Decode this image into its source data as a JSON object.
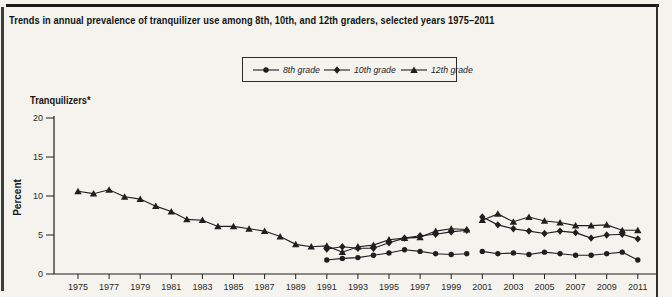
{
  "page": {
    "title": "Trends in annual prevalence of tranquilizer use among 8th, 10th, and 12th graders, selected years 1975–2011"
  },
  "legend": {
    "items": [
      {
        "label": "8th grade",
        "marker": "circle"
      },
      {
        "label": "10th grade",
        "marker": "diamond"
      },
      {
        "label": "12th grade",
        "marker": "triangle"
      }
    ]
  },
  "axis": {
    "substance_label": "Tranquilizers*",
    "y_axis_title": "Percent"
  },
  "colors": {
    "ink": "#1f1f1f",
    "background": "#f4f3ee",
    "border": "#1b1b1b"
  },
  "chart_data": {
    "type": "line",
    "title": "Trends in annual prevalence of tranquilizer use among 8th, 10th, and 12th graders, selected years 1975–2011",
    "xlabel": "",
    "ylabel": "Percent",
    "ylim": [
      0,
      20
    ],
    "y_ticks": [
      0,
      5,
      10,
      15,
      20
    ],
    "x_tick_labels": [
      "1975",
      "1977",
      "1979",
      "1981",
      "1983",
      "1985",
      "1987",
      "1989",
      "1991",
      "1993",
      "1995",
      "1997",
      "1999",
      "2001",
      "2003",
      "2005",
      "2007",
      "2009",
      "2011"
    ],
    "grid": false,
    "legend_position": "top-center",
    "line_break": "all series break between 2000 and 2001 (revised question indicated by asterisk)",
    "series": [
      {
        "name": "8th grade",
        "marker": "circle",
        "segments": [
          {
            "x": [
              1991,
              1992,
              1993,
              1994,
              1995,
              1996,
              1997,
              1998,
              1999,
              2000
            ],
            "y": [
              1.8,
              2.0,
              2.1,
              2.4,
              2.7,
              3.1,
              2.9,
              2.6,
              2.5,
              2.6
            ]
          },
          {
            "x": [
              2001,
              2002,
              2003,
              2004,
              2005,
              2006,
              2007,
              2008,
              2009,
              2010,
              2011
            ],
            "y": [
              2.9,
              2.6,
              2.7,
              2.5,
              2.8,
              2.6,
              2.4,
              2.4,
              2.6,
              2.8,
              1.8
            ]
          }
        ]
      },
      {
        "name": "10th grade",
        "marker": "diamond",
        "segments": [
          {
            "x": [
              1991,
              1992,
              1993,
              1994,
              1995,
              1996,
              1997,
              1998,
              1999,
              2000
            ],
            "y": [
              3.2,
              3.5,
              3.3,
              3.3,
              4.0,
              4.6,
              4.9,
              5.1,
              5.4,
              5.6
            ]
          },
          {
            "x": [
              2001,
              2002,
              2003,
              2004,
              2005,
              2006,
              2007,
              2008,
              2009,
              2010,
              2011
            ],
            "y": [
              7.3,
              6.3,
              5.8,
              5.5,
              5.2,
              5.5,
              5.3,
              4.6,
              5.0,
              5.1,
              4.5
            ]
          }
        ]
      },
      {
        "name": "12th grade",
        "marker": "triangle",
        "segments": [
          {
            "x": [
              1975,
              1976,
              1977,
              1978,
              1979,
              1980,
              1981,
              1982,
              1983,
              1984,
              1985,
              1986,
              1987,
              1988,
              1989,
              1990,
              1991,
              1992,
              1993,
              1994,
              1995,
              1996,
              1997,
              1998,
              1999,
              2000
            ],
            "y": [
              10.6,
              10.3,
              10.8,
              9.9,
              9.6,
              8.7,
              8.0,
              7.0,
              6.9,
              6.1,
              6.1,
              5.8,
              5.5,
              4.8,
              3.8,
              3.5,
              3.6,
              2.8,
              3.5,
              3.7,
              4.4,
              4.6,
              4.7,
              5.5,
              5.8,
              5.7
            ]
          },
          {
            "x": [
              2001,
              2002,
              2003,
              2004,
              2005,
              2006,
              2007,
              2008,
              2009,
              2010,
              2011
            ],
            "y": [
              6.9,
              7.7,
              6.7,
              7.3,
              6.8,
              6.6,
              6.2,
              6.2,
              6.3,
              5.6,
              5.6
            ]
          }
        ]
      }
    ]
  }
}
